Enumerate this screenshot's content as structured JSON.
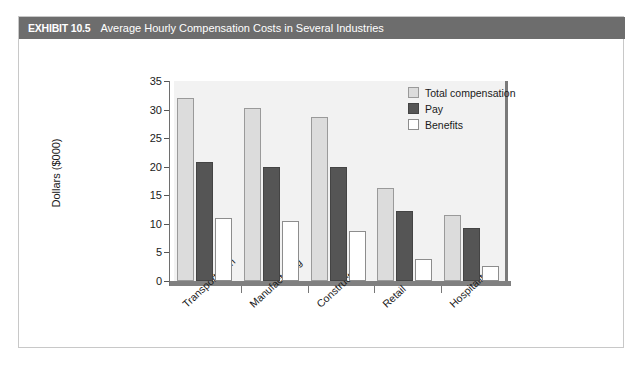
{
  "header": {
    "exhibit_label": "EXHIBIT 10.5",
    "title": "Average Hourly Compensation Costs in Several Industries",
    "bar_color": "#6d6d6d"
  },
  "legend": {
    "position": "top-right",
    "items": [
      {
        "label": "Total compensation",
        "color": "#dcdcdc",
        "swatch": "total"
      },
      {
        "label": "Pay",
        "color": "#555555",
        "swatch": "pay"
      },
      {
        "label": "Benefits",
        "color": "#ffffff",
        "swatch": "benefits"
      }
    ]
  },
  "chart_data": {
    "type": "bar",
    "title": "Average Hourly Compensation Costs in Several Industries",
    "xlabel": "",
    "ylabel": "Dollars ($000)",
    "ylim": [
      0,
      35
    ],
    "yticks": [
      0,
      5,
      10,
      15,
      20,
      25,
      30,
      35
    ],
    "ytick_labels": [
      "0",
      "5",
      "10",
      "15",
      "20",
      "25",
      "30",
      "35"
    ],
    "grid": false,
    "categories": [
      "Transportation",
      "Manufacturing",
      "Construction",
      "Retail",
      "Hospitality"
    ],
    "series": [
      {
        "name": "Total compensation",
        "color": "#dcdcdc",
        "values": [
          32.0,
          30.2,
          28.7,
          16.3,
          11.6
        ]
      },
      {
        "name": "Pay",
        "color": "#555555",
        "values": [
          20.8,
          20.0,
          20.0,
          12.3,
          9.2
        ]
      },
      {
        "name": "Benefits",
        "color": "#ffffff",
        "values": [
          11.1,
          10.5,
          8.8,
          3.9,
          2.7
        ]
      }
    ]
  }
}
